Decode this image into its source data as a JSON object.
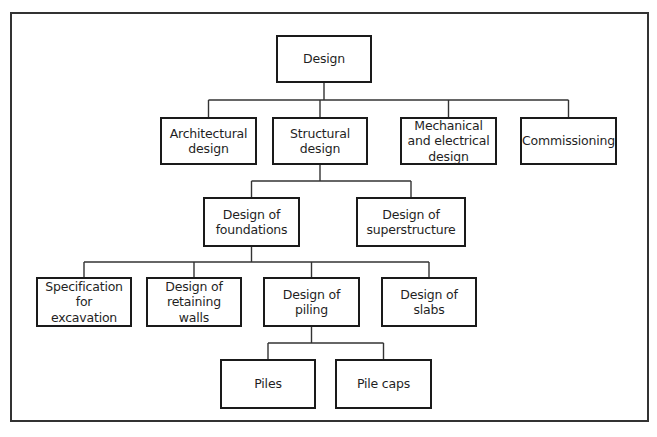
{
  "diagram": {
    "type": "hierarchy-tree",
    "root": "design",
    "nodes": {
      "design": {
        "label": "Design",
        "x": 276,
        "y": 35,
        "w": 96,
        "h": 48
      },
      "architectural": {
        "label": "Architectural\ndesign",
        "x": 160,
        "y": 117,
        "w": 97,
        "h": 48
      },
      "structural": {
        "label": "Structural\ndesign",
        "x": 272,
        "y": 117,
        "w": 96,
        "h": 48
      },
      "mechanical": {
        "label": "Mechanical\nand electrical\ndesign",
        "x": 400,
        "y": 117,
        "w": 97,
        "h": 48
      },
      "commissioning": {
        "label": "Commissioning",
        "x": 520,
        "y": 117,
        "w": 97,
        "h": 48
      },
      "foundations": {
        "label": "Design of\nfoundations",
        "x": 203,
        "y": 197,
        "w": 97,
        "h": 50
      },
      "superstructure": {
        "label": "Design of\nsuperstructure",
        "x": 356,
        "y": 197,
        "w": 110,
        "h": 50
      },
      "excavation": {
        "label": "Specification for\nexcavation",
        "x": 36,
        "y": 277,
        "w": 96,
        "h": 50
      },
      "retaining": {
        "label": "Design of\nretaining\nwalls",
        "x": 146,
        "y": 277,
        "w": 96,
        "h": 50
      },
      "piling": {
        "label": "Design of\npiling",
        "x": 263,
        "y": 277,
        "w": 97,
        "h": 50
      },
      "slabs": {
        "label": "Design of\nslabs",
        "x": 381,
        "y": 277,
        "w": 96,
        "h": 50
      },
      "piles": {
        "label": "Piles",
        "x": 220,
        "y": 359,
        "w": 96,
        "h": 50
      },
      "pile_caps": {
        "label": "Pile caps",
        "x": 335,
        "y": 359,
        "w": 97,
        "h": 50
      }
    },
    "edges": [
      [
        "design",
        "architectural"
      ],
      [
        "design",
        "structural"
      ],
      [
        "design",
        "mechanical"
      ],
      [
        "design",
        "commissioning"
      ],
      [
        "structural",
        "foundations"
      ],
      [
        "structural",
        "superstructure"
      ],
      [
        "foundations",
        "excavation"
      ],
      [
        "foundations",
        "retaining"
      ],
      [
        "foundations",
        "piling"
      ],
      [
        "foundations",
        "slabs"
      ],
      [
        "piling",
        "piles"
      ],
      [
        "piling",
        "pile_caps"
      ]
    ],
    "colors": {
      "line": "#1a1a1a",
      "connector": "#333333",
      "frame": "#333333",
      "background": "#ffffff"
    }
  }
}
